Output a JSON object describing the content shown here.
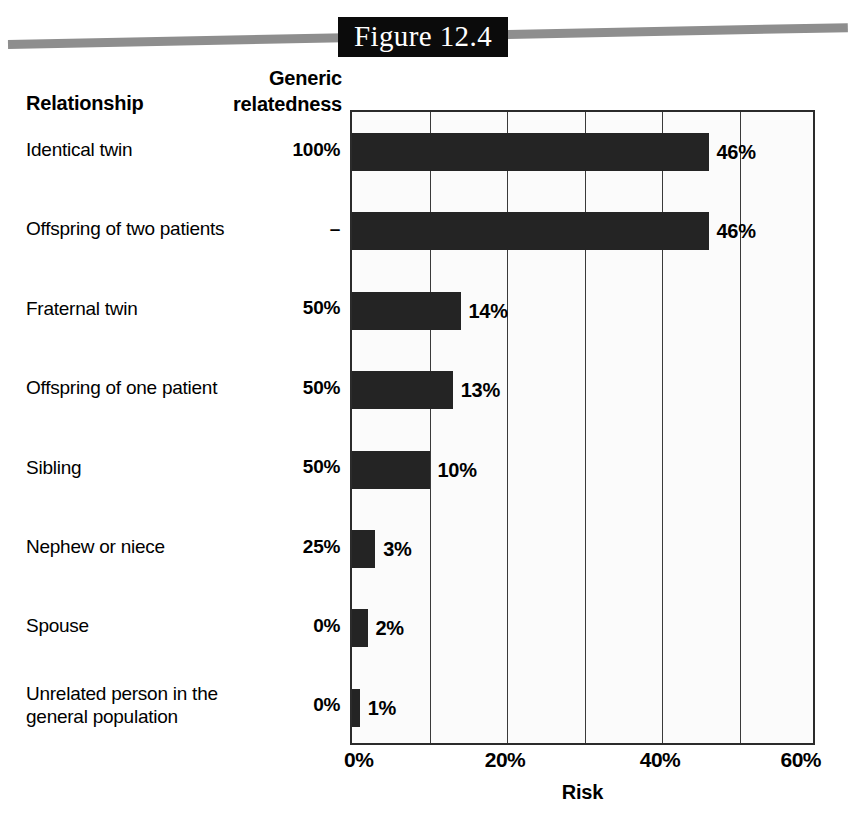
{
  "figure": {
    "title": "Figure 12.4"
  },
  "headers": {
    "relationship": "Relationship",
    "relatedness_line1": "Generic",
    "relatedness_line2": "relatedness"
  },
  "axis": {
    "x_title": "Risk",
    "x_ticks": [
      "0%",
      "20%",
      "40%",
      "60%"
    ],
    "x_tick_values": [
      0,
      20,
      40,
      60
    ],
    "x_gridlines": [
      0,
      10,
      20,
      30,
      40,
      50,
      60
    ],
    "x_min": 0,
    "x_max": 60
  },
  "rows": [
    {
      "label": "Identical twin",
      "relatedness": "100%",
      "risk_label": "46%",
      "risk": 46
    },
    {
      "label": "Offspring of two patients",
      "relatedness": "–",
      "risk_label": "46%",
      "risk": 46
    },
    {
      "label": "Fraternal twin",
      "relatedness": "50%",
      "risk_label": "14%",
      "risk": 14
    },
    {
      "label": "Offspring of one patient",
      "relatedness": "50%",
      "risk_label": "13%",
      "risk": 13
    },
    {
      "label": "Sibling",
      "relatedness": "50%",
      "risk_label": "10%",
      "risk": 10
    },
    {
      "label": "Nephew or niece",
      "relatedness": "25%",
      "risk_label": "3%",
      "risk": 3
    },
    {
      "label": "Spouse",
      "relatedness": "0%",
      "risk_label": "2%",
      "risk": 2
    },
    {
      "label": "Unrelated person in the\ngeneral population",
      "relatedness": "0%",
      "risk_label": "1%",
      "risk": 1
    }
  ],
  "colors": {
    "bar": "#242424",
    "plot_background": "#fbfbfb",
    "plot_border": "#2b2b2b",
    "gridline": "#3a3a3a",
    "title_box": "#0b0b0b",
    "title_text": "#ffffff",
    "band": "#8e8e8e"
  },
  "chart_data": {
    "type": "bar",
    "orientation": "horizontal",
    "title": "Figure 12.4",
    "xlabel": "Risk",
    "ylabel": "Relationship",
    "categories": [
      "Identical twin",
      "Offspring of two patients",
      "Fraternal twin",
      "Offspring of one patient",
      "Sibling",
      "Nephew or niece",
      "Spouse",
      "Unrelated person in the general population"
    ],
    "values": [
      46,
      46,
      14,
      13,
      10,
      3,
      2,
      1
    ],
    "value_labels": [
      "46%",
      "46%",
      "14%",
      "13%",
      "10%",
      "3%",
      "2%",
      "1%"
    ],
    "secondary_column": {
      "name": "Generic relatedness",
      "values": [
        "100%",
        "–",
        "50%",
        "50%",
        "50%",
        "25%",
        "0%",
        "0%"
      ]
    },
    "xlim": [
      0,
      60
    ],
    "xticks": [
      0,
      20,
      40,
      60
    ],
    "xticklabels": [
      "0%",
      "20%",
      "40%",
      "60%"
    ],
    "gridlines_x": [
      0,
      10,
      20,
      30,
      40,
      50,
      60
    ],
    "grid": true,
    "legend": false,
    "bar_color": "#242424"
  }
}
